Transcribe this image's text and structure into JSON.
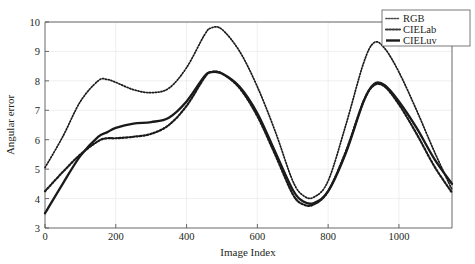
{
  "chart_data": {
    "type": "line",
    "title": "",
    "xlabel": "Image Index",
    "ylabel": "Angular error",
    "xlim": [
      0,
      1150
    ],
    "ylim": [
      3,
      10
    ],
    "xticks": [
      0,
      200,
      400,
      600,
      800,
      1000
    ],
    "yticks": [
      3,
      4,
      5,
      6,
      7,
      8,
      9,
      10
    ],
    "xtick_labels": [
      "0",
      "200",
      "400",
      "600",
      "800",
      "1000"
    ],
    "ytick_labels": [
      "3",
      "4",
      "5",
      "6",
      "7",
      "8",
      "9",
      "10"
    ],
    "grid": true,
    "legend_position": "top-right",
    "x": [
      0,
      50,
      100,
      150,
      175,
      200,
      250,
      300,
      350,
      400,
      450,
      470,
      500,
      550,
      600,
      650,
      700,
      730,
      760,
      800,
      850,
      900,
      930,
      960,
      1000,
      1050,
      1100,
      1150
    ],
    "series": [
      {
        "name": "RGB",
        "style": "dotted-fine",
        "color": "#4d4d4d",
        "values": [
          5.05,
          6.1,
          7.3,
          8.0,
          8.05,
          7.95,
          7.7,
          7.6,
          7.75,
          8.45,
          9.55,
          9.8,
          9.75,
          9.0,
          7.8,
          6.3,
          4.6,
          4.1,
          4.05,
          4.6,
          6.5,
          8.6,
          9.3,
          9.1,
          8.3,
          7.0,
          5.6,
          4.3
        ]
      },
      {
        "name": "CIELab",
        "style": "dotted",
        "color": "#3a3a3a",
        "values": [
          4.25,
          4.9,
          5.5,
          5.95,
          6.05,
          6.05,
          6.1,
          6.2,
          6.5,
          7.15,
          8.1,
          8.3,
          8.25,
          7.75,
          6.8,
          5.5,
          4.15,
          3.8,
          3.8,
          4.25,
          5.6,
          7.3,
          7.85,
          7.8,
          7.2,
          6.2,
          5.1,
          4.2
        ]
      },
      {
        "name": "CIELuv",
        "style": "solid",
        "color": "#1a1a1a",
        "values": [
          3.5,
          4.5,
          5.45,
          6.1,
          6.25,
          6.4,
          6.55,
          6.6,
          6.75,
          7.3,
          8.15,
          8.3,
          8.25,
          7.8,
          6.9,
          5.6,
          4.3,
          3.9,
          3.85,
          4.25,
          5.55,
          7.3,
          7.9,
          7.85,
          7.3,
          6.4,
          5.35,
          4.5
        ]
      }
    ]
  },
  "axes": {
    "xlabel": "Image Index",
    "ylabel": "Angular error"
  },
  "legend": {
    "items": [
      {
        "label": "RGB"
      },
      {
        "label": "CIELab"
      },
      {
        "label": "CIELuv"
      }
    ]
  },
  "ticks": {
    "x": [
      "0",
      "200",
      "400",
      "600",
      "800",
      "1000"
    ],
    "y": [
      "10",
      "9",
      "8",
      "7",
      "6",
      "5",
      "4",
      "3"
    ]
  }
}
